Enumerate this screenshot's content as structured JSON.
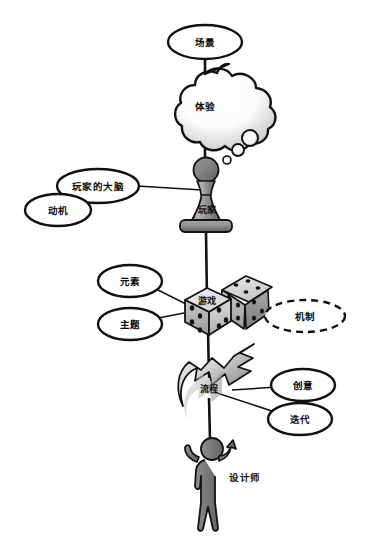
{
  "diagram": {
    "title_visible": false,
    "background_color": "#ffffff",
    "stroke_color": "#111111",
    "nodes": {
      "scene": {
        "label": "场景",
        "shape": "ellipse",
        "style": "solid"
      },
      "experience": {
        "label": "体验",
        "shape": "thought-cloud",
        "style": "solid"
      },
      "player_brain": {
        "label": "玩家的大脑",
        "shape": "ellipse",
        "style": "solid"
      },
      "motivation": {
        "label": "动机",
        "shape": "ellipse",
        "style": "solid"
      },
      "player": {
        "label": "玩家",
        "shape": "chess-pawn",
        "style": "solid"
      },
      "elements": {
        "label": "元素",
        "shape": "ellipse",
        "style": "solid"
      },
      "theme": {
        "label": "主题",
        "shape": "ellipse",
        "style": "solid"
      },
      "game": {
        "label": "游戏",
        "shape": "dice-pair",
        "style": "solid"
      },
      "mechanics": {
        "label": "机制",
        "shape": "ellipse",
        "style": "dashed"
      },
      "process": {
        "label": "流程",
        "shape": "spiral-arrow",
        "style": "solid"
      },
      "creativity": {
        "label": "创意",
        "shape": "ellipse",
        "style": "solid"
      },
      "iteration": {
        "label": "迭代",
        "shape": "ellipse",
        "style": "solid"
      },
      "designer": {
        "label": "设计师",
        "shape": "human-figure",
        "style": "solid"
      }
    },
    "edges": [
      {
        "from": "scene",
        "to": "experience"
      },
      {
        "from": "experience",
        "to": "player"
      },
      {
        "from": "player_brain",
        "to": "player"
      },
      {
        "from": "motivation",
        "to": "player_brain"
      },
      {
        "from": "player",
        "to": "game"
      },
      {
        "from": "elements",
        "to": "game"
      },
      {
        "from": "theme",
        "to": "game"
      },
      {
        "from": "game",
        "to": "mechanics"
      },
      {
        "from": "game",
        "to": "process"
      },
      {
        "from": "process",
        "to": "creativity"
      },
      {
        "from": "process",
        "to": "iteration"
      },
      {
        "from": "process",
        "to": "designer"
      }
    ],
    "colors": {
      "outline": "#111111",
      "pawn_fill_light": "#b9b9b9",
      "pawn_fill_dark": "#6f6f6f",
      "dice_fill_light": "#e8e8e8",
      "dice_fill_mid": "#bdbdbd",
      "dice_fill_dark": "#8e8e8e",
      "arrow_fill_light": "#f0f0f0",
      "arrow_fill_dark": "#8a8a8a",
      "figure_fill": "#8a8a8a",
      "cloud_fill": "#ffffff",
      "cloud_shadow": "#cfcfcf"
    }
  }
}
